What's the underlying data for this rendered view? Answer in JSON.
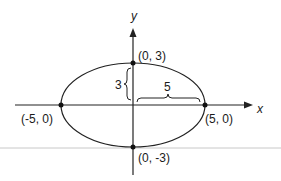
{
  "figure": {
    "axes": {
      "x_label": "x",
      "y_label": "y"
    },
    "points": {
      "top": "(0, 3)",
      "bottom": "(0, -3)",
      "left": "(-5, 0)",
      "right": "(5, 0)"
    },
    "measurements": {
      "semi_minor": "3",
      "semi_major": "5"
    },
    "colors": {
      "stroke": "#222222",
      "divider": "#c8c8c8",
      "background": "#ffffff"
    }
  }
}
